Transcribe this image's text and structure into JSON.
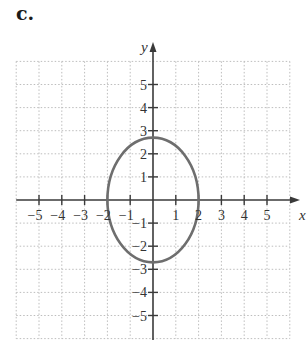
{
  "panel_label": "c.",
  "colors": {
    "axis": "#3a3a3a",
    "grid": "#bdbdbd",
    "curve": "#6e6e6e",
    "text": "#333333"
  },
  "chart_data": {
    "type": "line",
    "title": "",
    "panel_label": "c.",
    "xlabel": "x",
    "ylabel": "y",
    "xlim": [
      -6,
      6
    ],
    "ylim": [
      -6,
      6
    ],
    "grid": true,
    "grid_style": "dotted",
    "x_ticks": [
      -5,
      -4,
      -3,
      -2,
      -1,
      1,
      2,
      3,
      4,
      5
    ],
    "y_ticks": [
      -5,
      -4,
      -3,
      -2,
      -1,
      1,
      2,
      3,
      4,
      5
    ],
    "x_tick_labels": [
      "−5",
      "−4",
      "−3",
      "−2",
      "−1",
      "1",
      "2",
      "3",
      "4",
      "5"
    ],
    "y_tick_labels": [
      "−5",
      "−4",
      "−3",
      "−2",
      "−1",
      "1",
      "2",
      "3",
      "4",
      "5"
    ],
    "series": [
      {
        "name": "ellipse",
        "shape": "ellipse",
        "center": [
          0,
          0
        ],
        "semi_axis_x": 2,
        "semi_axis_y": 2.7,
        "points": [
          [
            2,
            0
          ],
          [
            0,
            2.7
          ],
          [
            -2,
            0
          ],
          [
            0,
            -2.7
          ]
        ]
      }
    ],
    "legend": null
  }
}
